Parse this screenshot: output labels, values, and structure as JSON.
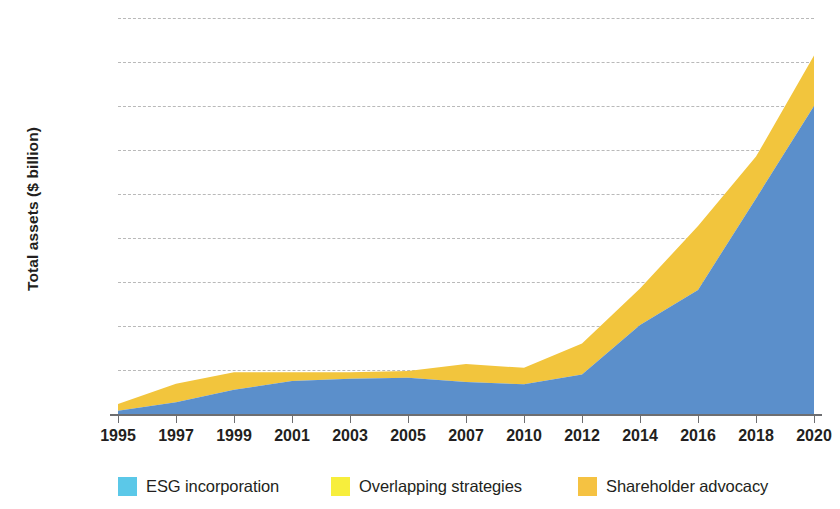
{
  "chart_data": {
    "type": "area",
    "stacked": true,
    "title": "",
    "subtitle": "",
    "xlabel": "",
    "ylabel": "Total assets ($ billion)",
    "x": [
      1995,
      1997,
      1999,
      2001,
      2003,
      2005,
      2007,
      2010,
      2012,
      2014,
      2016,
      2018,
      2020
    ],
    "tick_labels": [
      "1995",
      "1997",
      "1999",
      "2001",
      "2003",
      "2005",
      "2007",
      "2010",
      "2012",
      "2014",
      "2016",
      "2018",
      "2020"
    ],
    "ylim": [
      0,
      18000
    ],
    "yticks": [
      0,
      2000,
      4000,
      6000,
      8000,
      10000,
      12000,
      14000,
      16000,
      18000
    ],
    "ytick_labels": [
      "0",
      "2,000",
      "4,000",
      "6,000",
      "8,000",
      "10,000",
      "12,000",
      "14,000",
      "16,000",
      "18,000"
    ],
    "grid": "horizontal-dashed",
    "legend_position": "bottom",
    "series": [
      {
        "name": "ESG incorporation",
        "color": "#5B8FCB",
        "legend_color": "#5BC8E8",
        "values": [
          150,
          530,
          1100,
          1500,
          1600,
          1650,
          1450,
          1350,
          1800,
          4050,
          5640,
          9800,
          14000
        ]
      },
      {
        "name": "Overlapping strategies",
        "color": "#F2EC4A",
        "legend_color": "#F7EE3C",
        "values": [
          0,
          0,
          0,
          0,
          0,
          0,
          0,
          0,
          0,
          0,
          0,
          0,
          0
        ]
      },
      {
        "name": "Shareholder advocacy",
        "color": "#F2C53D",
        "legend_color": "#F5C242",
        "values": [
          300,
          840,
          800,
          400,
          300,
          300,
          820,
          750,
          1400,
          1650,
          2910,
          1900,
          2300
        ]
      }
    ],
    "totals": [
      450,
      1370,
      1900,
      1900,
      1900,
      1950,
      2270,
      2100,
      3200,
      5700,
      8550,
      11700,
      16300
    ]
  },
  "legend": {
    "items": [
      {
        "label": "ESG incorporation"
      },
      {
        "label": "Overlapping strategies"
      },
      {
        "label": "Shareholder advocacy"
      }
    ]
  }
}
